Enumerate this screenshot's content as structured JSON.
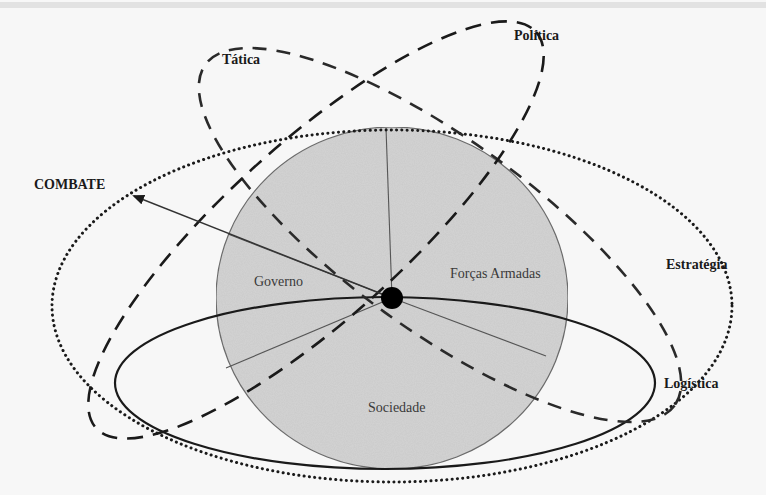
{
  "diagram": {
    "labels": {
      "tatica": "Tática",
      "politica": "Política",
      "combate": "COMBATE",
      "estrategia": "Estratégia",
      "logistica": "Logística"
    },
    "sectors": {
      "governo": "Governo",
      "forcas_armadas": "Forças Armadas",
      "sociedade": "Sociedade"
    },
    "colors": {
      "background": "#f7f7f7",
      "sphere_fill": "#d4d4d4",
      "sphere_stroke": "#6e6e6e",
      "lines": "#1a1a1a",
      "center_dot": "#000000"
    }
  }
}
